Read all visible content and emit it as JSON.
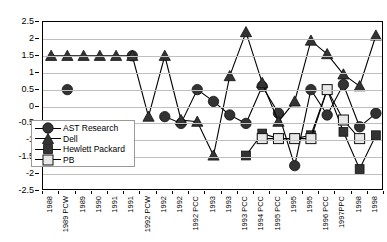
{
  "chart_data": {
    "type": "line",
    "title": "",
    "xlabel": "",
    "ylabel": "",
    "ylim": [
      -2.5,
      2.5
    ],
    "ytick_step": 0.5,
    "grid": true,
    "legend_position": "inside-left",
    "ytick_labels": [
      "2.5",
      "2",
      "1.5",
      "1",
      "0.5",
      "0",
      "-0.5",
      "-1",
      "-1.5",
      "-2",
      "-2.5"
    ],
    "categories": [
      "1988",
      "1989 PCW",
      "1989",
      "1990",
      "1991",
      "1991",
      "1992 PCW",
      "1992",
      "1992",
      "1992 PCC",
      "1993",
      "1993",
      "1993 PCC",
      "1994 PCC",
      "1995 PCC",
      "1995",
      "1995",
      "1996 PCC",
      "1997PPC",
      "1998",
      "1998"
    ],
    "series": [
      {
        "name": "AST Research",
        "marker": "filled-circle",
        "values": [
          null,
          0.5,
          null,
          null,
          null,
          1.5,
          null,
          -0.3,
          -0.5,
          0.5,
          0.15,
          -0.25,
          -0.5,
          0.6,
          -0.2,
          -1.75,
          0.5,
          -0.25,
          0.65,
          -0.6,
          -0.2
        ]
      },
      {
        "name": "Dell",
        "marker": "filled-triangle",
        "values": [
          1.5,
          1.5,
          1.5,
          1.5,
          1.5,
          1.5,
          -0.3,
          1.5,
          -0.4,
          -0.45,
          -1.45,
          0.9,
          2.2,
          0.7,
          -0.45,
          0.15,
          1.95,
          1.55,
          0.95,
          0.6,
          2.1
        ]
      },
      {
        "name": "Hewlett Packard",
        "marker": "filled-square",
        "values": [
          null,
          null,
          null,
          null,
          null,
          null,
          null,
          null,
          null,
          null,
          null,
          null,
          -1.45,
          -0.8,
          -0.95,
          -0.95,
          -0.85,
          0.5,
          -0.75,
          -1.85,
          -0.85
        ]
      },
      {
        "name": "PB",
        "marker": "open-square",
        "values": [
          null,
          null,
          null,
          null,
          null,
          null,
          null,
          null,
          null,
          null,
          null,
          null,
          null,
          -0.95,
          -0.95,
          -0.95,
          -0.95,
          0.5,
          -0.4,
          -0.95,
          null
        ]
      }
    ]
  },
  "legend": {
    "items": [
      {
        "label": "AST Research"
      },
      {
        "label": "Dell"
      },
      {
        "label": "Hewlett Packard"
      },
      {
        "label": "PB"
      }
    ]
  }
}
